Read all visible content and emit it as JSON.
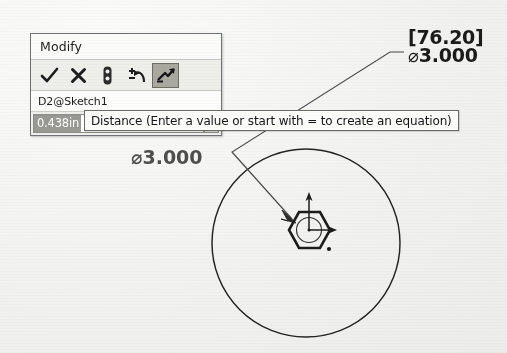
{
  "app": {
    "kind": "cad-sketch-dimension-editor"
  },
  "dialog": {
    "title": "Modify",
    "toolbar": [
      {
        "name": "accept-check-icon",
        "glyph": "✓",
        "active": false
      },
      {
        "name": "cancel-cross-icon",
        "glyph": "✘",
        "active": false
      },
      {
        "name": "thumbtack-icon",
        "glyph": "",
        "active": false
      },
      {
        "name": "rebuild-undo-icon",
        "glyph": "",
        "active": false
      },
      {
        "name": "sensor-tool-icon",
        "glyph": "",
        "active": true
      }
    ],
    "dimension_name": "D2@Sketch1",
    "value": "0.438in",
    "value_selected": true,
    "spinner_up": "▲",
    "spinner_down": "▼"
  },
  "tooltip": {
    "text": "Distance (Enter a value or start with = to create an equation)"
  },
  "callout": {
    "bracketed_value": "[76.20]",
    "diameter_symbol": "⌀",
    "diameter_value": "3.000"
  },
  "obscured_dimension": {
    "text": "⌀3.000"
  },
  "sketch": {
    "circle": {
      "cx": 306,
      "cy": 243,
      "r": 94
    },
    "hexagon": {
      "cx": 309,
      "cy": 230,
      "r": 20
    },
    "origin_marker": {
      "x": 309,
      "y": 230
    },
    "point_marker": {
      "x": 328,
      "y": 247
    },
    "leader_arrow_target": {
      "x": 296,
      "y": 222
    },
    "colors": {
      "ink": "#1f1f1f",
      "leader": "#3a3a3a",
      "paper": "#f2f2f0",
      "highlight": "#9a9a94"
    }
  }
}
